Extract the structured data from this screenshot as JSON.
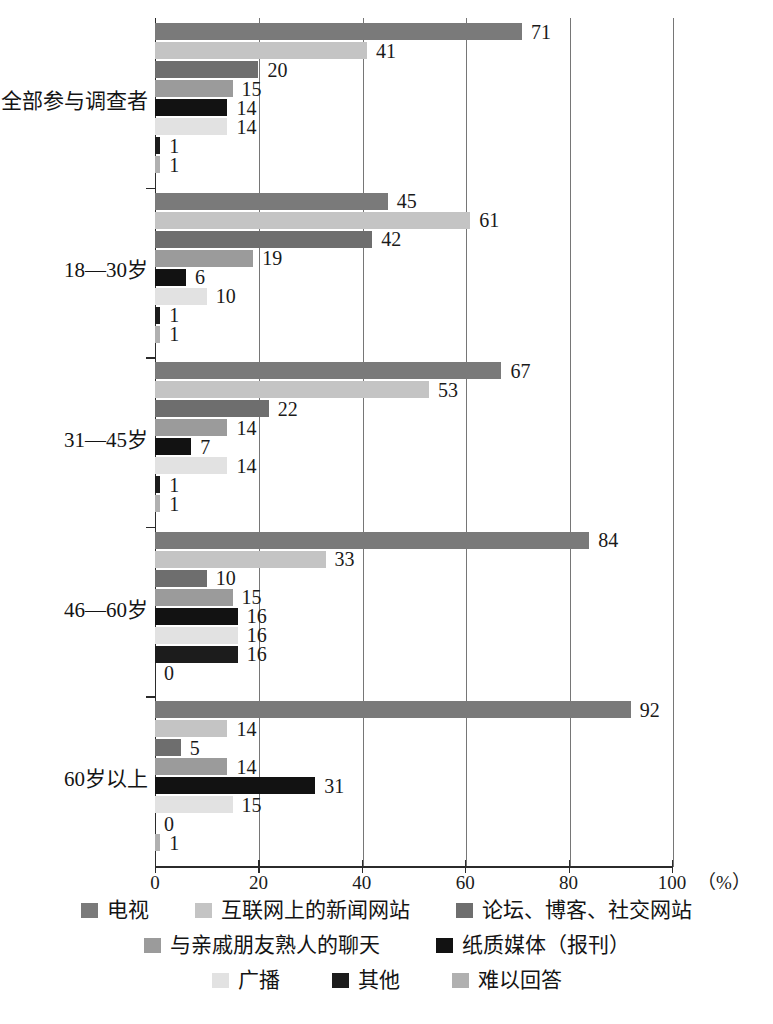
{
  "chart_data": {
    "type": "bar",
    "orientation": "horizontal",
    "title": "",
    "subtitle": "",
    "xlabel": "（%）",
    "ylabel": "",
    "xlim": [
      0,
      100
    ],
    "xticks": [
      0,
      20,
      40,
      60,
      80,
      100
    ],
    "xtick_labels": [
      "0",
      "20",
      "40",
      "60",
      "80",
      "100"
    ],
    "grid": true,
    "grid_axis": "x",
    "legend_position": "bottom",
    "categories": [
      "全部参与调查者",
      "18—30岁",
      "31—45岁",
      "46—60岁",
      "60岁以上"
    ],
    "series": [
      {
        "name": "电视",
        "color": "#7a7a7a",
        "values": [
          71,
          45,
          67,
          84,
          92
        ]
      },
      {
        "name": "互联网上的新闻网站",
        "color": "#c4c4c4",
        "values": [
          41,
          61,
          53,
          33,
          14
        ]
      },
      {
        "name": "论坛、博客、社交网站",
        "color": "#6e6e6e",
        "values": [
          20,
          42,
          22,
          10,
          5
        ]
      },
      {
        "name": "与亲戚朋友熟人的聊天",
        "color": "#9b9b9b",
        "values": [
          15,
          19,
          14,
          15,
          14
        ]
      },
      {
        "name": "纸质媒体（报刊）",
        "color": "#121212",
        "values": [
          14,
          6,
          7,
          16,
          31
        ]
      },
      {
        "name": "广播",
        "color": "#e2e2e2",
        "values": [
          14,
          10,
          14,
          16,
          15
        ]
      },
      {
        "name": "其他",
        "color": "#1c1c1c",
        "values": [
          1,
          1,
          1,
          16,
          0
        ]
      },
      {
        "name": "难以回答",
        "color": "#b0b0b0",
        "values": [
          1,
          1,
          1,
          0,
          1
        ]
      }
    ],
    "data_labels": [
      [
        "71",
        "41",
        "20",
        "15",
        "14",
        "14",
        "1",
        "1"
      ],
      [
        "45",
        "61",
        "42",
        "19",
        "6",
        "10",
        "1",
        "1"
      ],
      [
        "67",
        "53",
        "22",
        "14",
        "7",
        "14",
        "1",
        "1"
      ],
      [
        "84",
        "33",
        "10",
        "15",
        "16",
        "16",
        "16",
        "0"
      ],
      [
        "92",
        "14",
        "5",
        "14",
        "31",
        "15",
        "0",
        "1"
      ]
    ]
  },
  "axis": {
    "unit_label": "（%）"
  }
}
